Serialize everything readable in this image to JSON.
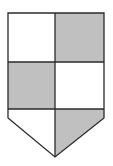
{
  "diagram": {
    "colors": {
      "background": "#ffffff",
      "fill_dark": "#c0c0c0",
      "fill_light": "#ffffff",
      "outline": "#2a2a2a"
    },
    "shield": {
      "left": 8,
      "right": 104,
      "top": 13,
      "center_x": 55,
      "row1_bottom": 62,
      "row2_bottom": 109,
      "side_bottom": 118,
      "point_y": 157
    },
    "cells": [
      {
        "id": "top-left",
        "shade": "light"
      },
      {
        "id": "top-right",
        "shade": "dark"
      },
      {
        "id": "middle-left",
        "shade": "dark"
      },
      {
        "id": "middle-right",
        "shade": "light"
      },
      {
        "id": "base-left",
        "shade": "light"
      },
      {
        "id": "base-right",
        "shade": "dark"
      }
    ]
  }
}
